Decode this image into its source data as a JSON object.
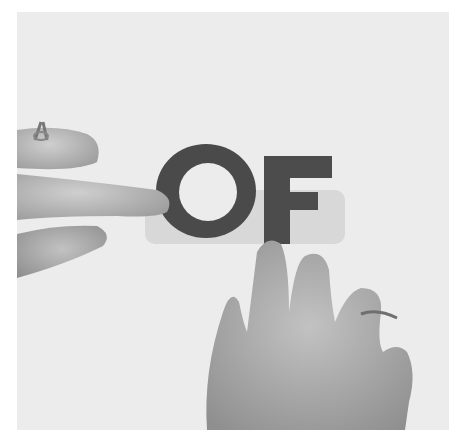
{
  "image": {
    "description": "Grayscale photograph of two hands pointing at large cut-out letters on a light background",
    "letters": "OF",
    "colors": {
      "background": "#ececec",
      "letters": "#4a4a4a",
      "skin_light": "#c8c8c8",
      "skin_mid": "#a8a8a8",
      "skin_dark": "#8c8c8c",
      "shadow": "#d6d6d6"
    }
  }
}
